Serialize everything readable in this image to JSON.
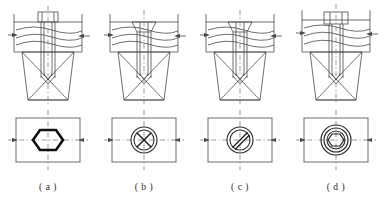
{
  "figure": {
    "title": "",
    "background_color": "#ffffff",
    "line_color": "#4a4a4a",
    "heavy_line_color": "#111111",
    "center_line_color": "#6e6e6e",
    "panel_count": 4,
    "view_layout": "section view above, plan view below"
  },
  "captions": {
    "a": "( a )",
    "b": "( b )",
    "c": "( c )",
    "d": "( d )"
  },
  "panels": [
    {
      "id": "a",
      "caption": "( a )",
      "fastener": "hex-head-bolt",
      "head_style": "hexagon head, projecting above plate",
      "section_view": {
        "name": "hex-bolt-section",
        "plate": "horizontal plate with hatching",
        "body": "tapered block with tapped hole",
        "head_above_plate": true
      },
      "plan_view": {
        "name": "hex-bolt-plan",
        "outline": "rectangle",
        "symbol": "bold-hexagon",
        "center_lines": true
      }
    },
    {
      "id": "b",
      "caption": "( b )",
      "fastener": "countersunk-cross-recess-screw",
      "head_style": "countersunk flat head, cross recess",
      "section_view": {
        "name": "cross-recess-screw-section",
        "plate": "horizontal plate with hatching",
        "body": "tapered block with tapped hole",
        "head_above_plate": false
      },
      "plan_view": {
        "name": "cross-recess-screw-plan",
        "outline": "rectangle",
        "symbol": "double-circle-with-cross",
        "center_lines": true
      }
    },
    {
      "id": "c",
      "caption": "( c )",
      "fastener": "countersunk-slotted-screw",
      "head_style": "countersunk flat head, straight slot",
      "section_view": {
        "name": "slotted-screw-section",
        "plate": "horizontal plate with hatching",
        "body": "tapered block with tapped hole",
        "head_above_plate": false
      },
      "plan_view": {
        "name": "slotted-screw-plan",
        "outline": "rectangle",
        "symbol": "double-circle-with-diagonal-slot",
        "center_lines": true
      }
    },
    {
      "id": "d",
      "caption": "( d )",
      "fastener": "socket-head-cap-screw",
      "head_style": "cylindrical head with hex socket, counterbored",
      "section_view": {
        "name": "socket-head-screw-section",
        "plate": "horizontal plate with hatching",
        "body": "tapered block with tapped hole",
        "head_above_plate": true
      },
      "plan_view": {
        "name": "socket-head-screw-plan",
        "outline": "rectangle",
        "symbol": "concentric-circles-with-hexagon-socket",
        "center_lines": true
      }
    }
  ]
}
